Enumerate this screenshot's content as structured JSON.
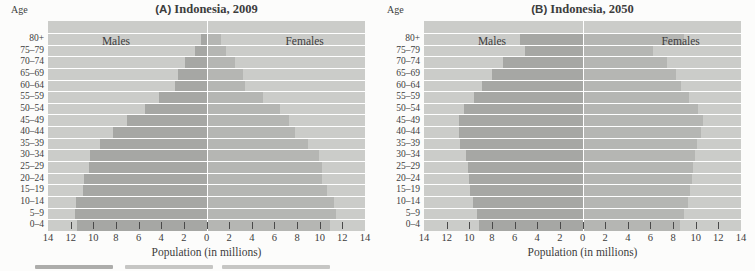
{
  "figure": {
    "age_axis_label": "Age",
    "x_axis_title": "Population (in millions)",
    "x_tick_labels": [
      "14",
      "12",
      "10",
      "8",
      "6",
      "4",
      "2",
      "0",
      "2",
      "4",
      "6",
      "8",
      "10",
      "12",
      "14"
    ],
    "tick_mark_values": [
      -12,
      -10,
      -8,
      -6,
      -4,
      -2,
      0,
      2,
      4,
      6,
      8,
      10,
      12
    ],
    "half_axis_max": 14
  },
  "colors": {
    "male_bar": "#a6a7a4",
    "female_bar": "#b5b6b3",
    "band_background": "#cbccc9",
    "row_separator": "#ffffff",
    "tick": "#4a4a4a",
    "text": "#3d3d3d",
    "page_background": "#fcfcfb"
  },
  "chart_data": [
    {
      "type": "bar",
      "variant": "population-pyramid",
      "title_prefix": "(A)",
      "title": "Indonesia, 2009",
      "left_series_label": "Males",
      "right_series_label": "Females",
      "xlabel": "Population (in millions)",
      "xlim": [
        -14,
        14
      ],
      "grid": "horizontal-band-separators",
      "legend_position": "inside-top",
      "categories": [
        "80+",
        "75–79",
        "70–74",
        "65–69",
        "60–64",
        "55–59",
        "50–54",
        "45–49",
        "40–44",
        "35–39",
        "30–34",
        "25–29",
        "20–24",
        "15–19",
        "10–14",
        "5–9",
        "0–4"
      ],
      "series": [
        {
          "name": "Males",
          "values": [
            0.5,
            1.0,
            1.9,
            2.5,
            2.8,
            4.2,
            5.4,
            7.0,
            8.3,
            9.4,
            10.3,
            10.4,
            10.8,
            10.9,
            11.5,
            11.6,
            11.4
          ]
        },
        {
          "name": "Females",
          "values": [
            1.3,
            1.7,
            2.5,
            3.2,
            3.4,
            5.0,
            6.5,
            7.3,
            7.8,
            9.0,
            9.9,
            10.2,
            10.2,
            10.6,
            11.3,
            11.4,
            10.9
          ]
        }
      ]
    },
    {
      "type": "bar",
      "variant": "population-pyramid",
      "title_prefix": "(B)",
      "title": "Indonesia, 2050",
      "left_series_label": "Males",
      "right_series_label": "Females",
      "xlabel": "Population (in millions)",
      "xlim": [
        -14,
        14
      ],
      "grid": "horizontal-band-separators",
      "legend_position": "inside-top",
      "categories": [
        "80+",
        "75–79",
        "70–74",
        "65–69",
        "60–64",
        "55–59",
        "50–54",
        "45–49",
        "40–44",
        "35–39",
        "30–34",
        "25–29",
        "20–24",
        "15–19",
        "10–14",
        "5–9",
        "0–4"
      ],
      "series": [
        {
          "name": "Males",
          "values": [
            5.5,
            5.1,
            7.0,
            8.0,
            8.9,
            9.6,
            10.5,
            10.9,
            10.9,
            10.8,
            10.3,
            10.1,
            10.0,
            9.9,
            9.7,
            9.3,
            9.1
          ]
        },
        {
          "name": "Females",
          "values": [
            9.0,
            6.2,
            7.5,
            8.3,
            8.7,
            9.4,
            10.2,
            10.6,
            10.5,
            10.1,
            9.9,
            9.8,
            9.7,
            9.5,
            9.3,
            9.0,
            8.6
          ]
        }
      ]
    }
  ]
}
